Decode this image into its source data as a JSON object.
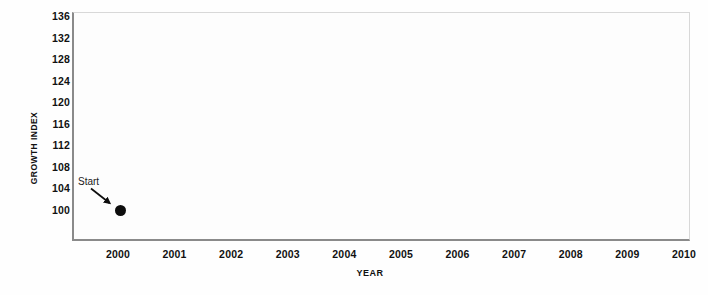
{
  "chart_data": {
    "type": "scatter",
    "title": "",
    "xlabel": "YEAR",
    "ylabel": "GROWTH INDEX",
    "x": [
      2000
    ],
    "values": [
      100
    ],
    "series": [
      {
        "name": "Growth index",
        "x": [
          2000
        ],
        "values": [
          100
        ],
        "marker": "filled-circle",
        "color": "#0d0d0d"
      }
    ],
    "xlim": [
      2000,
      2010
    ],
    "ylim": [
      96,
      136
    ],
    "xticks": [
      2000,
      2001,
      2002,
      2003,
      2004,
      2005,
      2006,
      2007,
      2008,
      2009,
      2010
    ],
    "yticks": [
      100,
      104,
      108,
      112,
      116,
      120,
      124,
      128,
      132,
      136
    ],
    "xtick_labels": [
      "2000",
      "2001",
      "2002",
      "2003",
      "2004",
      "2005",
      "2006",
      "2007",
      "2008",
      "2009",
      "2010"
    ],
    "ytick_labels": [
      "136",
      "132",
      "128",
      "124",
      "120",
      "116",
      "112",
      "108",
      "104",
      "100"
    ],
    "grid": false,
    "legend": null,
    "annotations": [
      {
        "text": "Start",
        "target_x": 2000,
        "target_y": 100,
        "arrow": true
      }
    ]
  },
  "axes": {
    "y_title": "GROWTH INDEX",
    "x_title": "YEAR"
  },
  "annotation": {
    "start_label": "Start"
  },
  "colors": {
    "marker": "#0d0d0d",
    "axis_line": "#8a8a8a",
    "plot_background": "#fdfdfd",
    "page_background": "#ffffff",
    "text": "#111111"
  }
}
